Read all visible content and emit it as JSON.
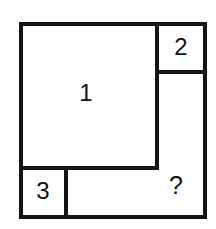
{
  "figure": {
    "kind": "rectangle-dissection-puzzle",
    "stroke_color": "#141414",
    "fill_color": "#ffffff",
    "background_color": "#ffffff",
    "stroke_width": 4,
    "outer": {
      "name": "outer-square",
      "x": 21,
      "y": 24,
      "width": 184,
      "height": 193
    },
    "regions": [
      {
        "id": "region-1",
        "label": "1",
        "x": 21,
        "y": 24,
        "width": 136,
        "height": 144,
        "label_x": 86,
        "label_y": 95
      },
      {
        "id": "region-2",
        "label": "2",
        "x": 157,
        "y": 24,
        "width": 48,
        "height": 48,
        "label_x": 181,
        "label_y": 49
      },
      {
        "id": "region-3",
        "label": "3",
        "x": 21,
        "y": 168,
        "width": 45,
        "height": 49,
        "label_x": 43,
        "label_y": 193
      },
      {
        "id": "region-unknown",
        "label": "?",
        "x": 157,
        "y": 72,
        "width": 48,
        "height": 145,
        "label_x": 176,
        "label_y": 187
      }
    ],
    "internal_edges": [
      {
        "id": "edge-region1-right",
        "orientation": "vertical",
        "x1": 157,
        "y1": 24,
        "x2": 157,
        "y2": 168
      },
      {
        "id": "edge-region1-bottom",
        "orientation": "horizontal",
        "x1": 21,
        "y1": 168,
        "x2": 157,
        "y2": 168
      },
      {
        "id": "edge-region2-bottom",
        "orientation": "horizontal",
        "x1": 157,
        "y1": 72,
        "x2": 205,
        "y2": 72
      },
      {
        "id": "edge-region3-right",
        "orientation": "vertical",
        "x1": 66,
        "y1": 168,
        "x2": 66,
        "y2": 217
      }
    ]
  }
}
